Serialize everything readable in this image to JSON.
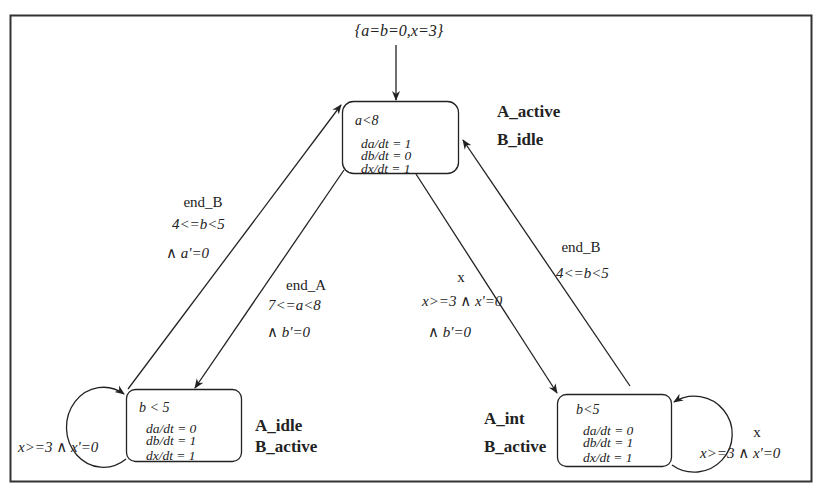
{
  "diagram": {
    "type": "hybrid-automaton",
    "initial": {
      "label": "{a=b=0,x=3}"
    },
    "states": [
      {
        "id": "top",
        "invariant": "a<8",
        "flows": [
          "da/dt = 1",
          "db/dt = 0",
          "dx/dt = 1"
        ],
        "name_lines": [
          "A_active",
          "B_idle"
        ]
      },
      {
        "id": "bottom_left",
        "invariant": "b < 5",
        "flows": [
          "da/dt = 0",
          "db/dt = 1",
          "dx/dt = 1"
        ],
        "name_lines": [
          "A_idle",
          "B_active"
        ]
      },
      {
        "id": "bottom_right",
        "invariant": "b<5",
        "flows": [
          "da/dt = 0",
          "db/dt = 1",
          "dx/dt = 1"
        ],
        "name_lines": [
          "A_int",
          "B_active"
        ]
      }
    ],
    "transitions": [
      {
        "id": "bl_to_top",
        "event": "end_B",
        "guard": "4<=b<5",
        "reset": "∧ a'=0"
      },
      {
        "id": "top_to_bl",
        "event": "end_A",
        "guard": "7<=a<8",
        "reset": "∧ b'=0"
      },
      {
        "id": "top_to_br",
        "event": "x",
        "guard": "x>=3 ∧ x'=0",
        "reset": "∧ b'=0"
      },
      {
        "id": "br_to_top",
        "event": "end_B",
        "guard": "4<=b<5",
        "reset": ""
      },
      {
        "id": "bl_self_loop",
        "event": "",
        "guard": "x>=3 ∧ x'=0",
        "reset": ""
      },
      {
        "id": "br_self_loop",
        "event": "x",
        "guard": "x>=3 ∧ x'=0",
        "reset": ""
      }
    ]
  }
}
